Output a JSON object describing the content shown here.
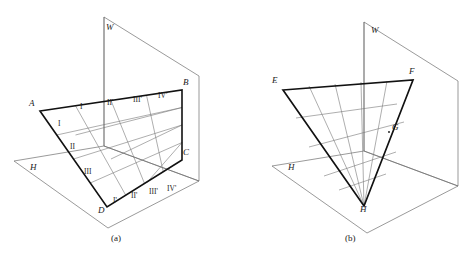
{
  "figure": {
    "stroke_colors": {
      "plane_outline": "#6f6f6f",
      "grid_line": "#777777",
      "figure_outline": "#111111"
    },
    "panels": [
      {
        "id": "panel-a",
        "caption": "(a)",
        "caption_pos": {
          "x": 111,
          "y": 238
        },
        "planes": [
          {
            "name": "W",
            "label": "W",
            "label_pos": {
              "x": 106,
              "y": 27
            }
          },
          {
            "name": "H",
            "label": "H",
            "label_pos": {
              "x": 30,
              "y": 167
            }
          }
        ],
        "quad_vertices": [
          {
            "label": "A",
            "label_pos": {
              "x": 29,
              "y": 103
            },
            "x": 40,
            "y": 111
          },
          {
            "label": "B",
            "label_pos": {
              "x": 183,
              "y": 82
            },
            "x": 182,
            "y": 90
          },
          {
            "label": "C",
            "label_pos": {
              "x": 183,
              "y": 152
            },
            "x": 182,
            "y": 160
          },
          {
            "label": "D",
            "label_pos": {
              "x": 98,
              "y": 210
            },
            "x": 107,
            "y": 207
          }
        ],
        "edge_labels_left": [
          {
            "text": "I",
            "x": 58,
            "y": 124
          },
          {
            "text": "II",
            "x": 70,
            "y": 147
          },
          {
            "text": "III",
            "x": 84,
            "y": 172
          }
        ],
        "edge_labels_top": [
          {
            "text": "I",
            "x": 80,
            "y": 107
          },
          {
            "text": "II'",
            "x": 107,
            "y": 103
          },
          {
            "text": "III'",
            "x": 133,
            "y": 100
          },
          {
            "text": "IV'",
            "x": 158,
            "y": 96
          }
        ],
        "edge_labels_bottom": [
          {
            "text": "I'",
            "x": 113,
            "y": 201
          },
          {
            "text": "II'",
            "x": 132,
            "y": 196
          },
          {
            "text": "III'",
            "x": 150,
            "y": 192
          },
          {
            "text": "IV'",
            "x": 167,
            "y": 189
          }
        ],
        "grid_divisions": 4
      },
      {
        "id": "panel-b",
        "caption": "(b)",
        "caption_pos": {
          "x": 345,
          "y": 238
        },
        "planes": [
          {
            "name": "W",
            "label": "W",
            "label_pos": {
              "x": 371,
              "y": 30
            }
          },
          {
            "name": "H",
            "label": "H",
            "label_pos": {
              "x": 288,
              "y": 167
            }
          }
        ],
        "triangle_vertices": [
          {
            "label": "E",
            "label_pos": {
              "x": 272,
              "y": 80
            },
            "x": 283,
            "y": 90
          },
          {
            "label": "F",
            "label_pos": {
              "x": 409,
              "y": 71
            },
            "x": 413,
            "y": 80
          },
          {
            "label": "H",
            "label_pos": {
              "x": 360,
              "y": 209
            },
            "x": 364,
            "y": 206
          }
        ],
        "point_labels": [
          {
            "label": "G",
            "label_pos": {
              "x": 392,
              "y": 127
            },
            "x": 389,
            "y": 132
          }
        ],
        "grid_divisions": 5
      }
    ]
  }
}
